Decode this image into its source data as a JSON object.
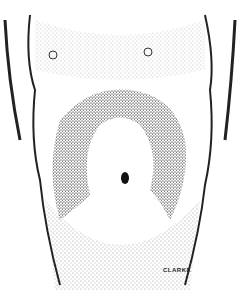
{
  "illustration": {
    "subject": "stippled anterior view of a torso showing abdominal wall distension",
    "signature": "CLARKE",
    "colors": {
      "ink": "#1a1a1a",
      "paper": "#ffffff"
    }
  }
}
